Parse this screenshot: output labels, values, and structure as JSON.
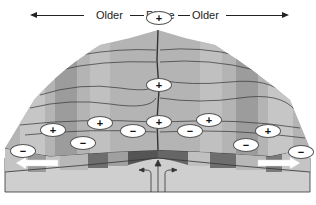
{
  "header": {
    "left_label": "Older",
    "center_label": "Ridge",
    "right_label": "Older"
  },
  "icons": {
    "arrow_left": "left-arrow",
    "arrow_right": "right-arrow",
    "spreading_left": "spreading-arrow-left",
    "spreading_right": "spreading-arrow-right",
    "upwelling": "upwelling-arrows"
  },
  "polarity_markers": [
    {
      "symbol": "+",
      "x": 146,
      "y": 11
    },
    {
      "symbol": "+",
      "x": 146,
      "y": 78
    },
    {
      "symbol": "+",
      "x": 146,
      "y": 115
    },
    {
      "symbol": "+",
      "x": 196,
      "y": 113
    },
    {
      "symbol": "+",
      "x": 40,
      "y": 123
    },
    {
      "symbol": "+",
      "x": 87,
      "y": 116
    },
    {
      "symbol": "+",
      "x": 255,
      "y": 124
    },
    {
      "symbol": "−",
      "x": 120,
      "y": 124
    },
    {
      "symbol": "−",
      "x": 177,
      "y": 124
    },
    {
      "symbol": "−",
      "x": 70,
      "y": 136
    },
    {
      "symbol": "−",
      "x": 233,
      "y": 138
    },
    {
      "symbol": "−",
      "x": 10,
      "y": 144
    },
    {
      "symbol": "−",
      "x": 288,
      "y": 145
    }
  ],
  "colors": {
    "stripe_light": "#c8c8c8",
    "stripe_mid": "#a8a8a8",
    "stripe_dark": "#6e6e6e",
    "surface": "#b4b4b4",
    "base": "#cfcfcf",
    "outline": "#333333",
    "arrow_fill": "#ffffff"
  }
}
